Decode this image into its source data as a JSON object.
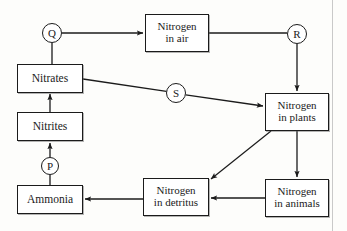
{
  "diagram": {
    "background_color": "#fdfdfb",
    "stroke_color": "#1b1b1b",
    "page_edge_color": "#c9c9c9",
    "nodes": [
      {
        "id": "nitrates",
        "shape": "box",
        "lines": [
          "Nitrates"
        ],
        "x": 17,
        "y": 64,
        "w": 66,
        "h": 29
      },
      {
        "id": "nitrites",
        "shape": "box",
        "lines": [
          "Nitrites"
        ],
        "x": 17,
        "y": 112,
        "w": 66,
        "h": 29
      },
      {
        "id": "ammonia",
        "shape": "box",
        "lines": [
          "Ammonia"
        ],
        "x": 17,
        "y": 185,
        "w": 66,
        "h": 29
      },
      {
        "id": "nitrogen-in-air",
        "shape": "box",
        "lines": [
          "Nitrogen",
          "in air"
        ],
        "x": 145,
        "y": 14,
        "w": 64,
        "h": 38
      },
      {
        "id": "nitrogen-in-plants",
        "shape": "box",
        "lines": [
          "Nitrogen",
          "in plants"
        ],
        "x": 265,
        "y": 93,
        "w": 64,
        "h": 38
      },
      {
        "id": "nitrogen-in-detritus",
        "shape": "box",
        "lines": [
          "Nitrogen",
          "in detritus"
        ],
        "x": 143,
        "y": 178,
        "w": 66,
        "h": 38
      },
      {
        "id": "nitrogen-in-animals",
        "shape": "box",
        "lines": [
          "Nitrogen",
          "in animals"
        ],
        "x": 265,
        "y": 179,
        "w": 64,
        "h": 38
      },
      {
        "id": "process-q",
        "shape": "circle",
        "label": "Q",
        "cx": 52,
        "cy": 33,
        "r": 10
      },
      {
        "id": "process-r",
        "shape": "circle",
        "label": "R",
        "cx": 297,
        "cy": 34,
        "r": 10
      },
      {
        "id": "process-s",
        "shape": "circle",
        "label": "S",
        "cx": 176,
        "cy": 93,
        "r": 10
      },
      {
        "id": "process-p",
        "shape": "circle",
        "label": "P",
        "cx": 50,
        "cy": 166,
        "r": 9
      }
    ],
    "edges": [
      {
        "id": "nitrates-to-q",
        "from": "nitrates",
        "to": "process-q",
        "arrow": false
      },
      {
        "id": "q-to-air",
        "from": "process-q",
        "to": "nitrogen-in-air",
        "arrow": true
      },
      {
        "id": "air-to-r",
        "from": "nitrogen-in-air",
        "to": "process-r",
        "arrow": false
      },
      {
        "id": "r-to-plants",
        "from": "process-r",
        "to": "nitrogen-in-plants",
        "arrow": true
      },
      {
        "id": "nitrates-to-s",
        "from": "nitrates",
        "to": "process-s",
        "arrow": false
      },
      {
        "id": "s-to-plants",
        "from": "process-s",
        "to": "nitrogen-in-plants",
        "arrow": true
      },
      {
        "id": "plants-to-animals",
        "from": "nitrogen-in-plants",
        "to": "nitrogen-in-animals",
        "arrow": true
      },
      {
        "id": "plants-to-detritus",
        "from": "nitrogen-in-plants",
        "to": "nitrogen-in-detritus",
        "arrow": true
      },
      {
        "id": "animals-to-detritus",
        "from": "nitrogen-in-animals",
        "to": "nitrogen-in-detritus",
        "arrow": true
      },
      {
        "id": "detritus-to-ammonia",
        "from": "nitrogen-in-detritus",
        "to": "ammonia",
        "arrow": true
      },
      {
        "id": "ammonia-to-p",
        "from": "ammonia",
        "to": "process-p",
        "arrow": false
      },
      {
        "id": "p-to-nitrites",
        "from": "process-p",
        "to": "nitrites",
        "arrow": true
      },
      {
        "id": "nitrites-to-nitrates",
        "from": "nitrites",
        "to": "nitrates",
        "arrow": true
      }
    ]
  }
}
